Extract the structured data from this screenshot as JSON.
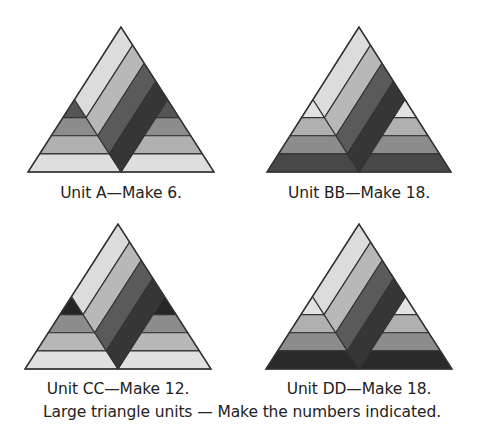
{
  "figure": {
    "caption": "Large triangle units — Make the numbers indicated.",
    "stroke_color": "#333333",
    "units": [
      {
        "id": "A",
        "label": "Unit A—Make 6.",
        "quantity": 6,
        "geometry": {
          "apex_x": 121,
          "apex_y": 27,
          "half_width": 93,
          "height": 145
        },
        "caption_pos": {
          "x": 121,
          "y": 184
        },
        "diagonal_stripes": [
          "#dcdcdc",
          "#b8b8b8",
          "#5a5a5a",
          "#363636"
        ],
        "side_bands": [
          "#555555",
          "#8c8c8c",
          "#b0b0b0",
          "#dedede"
        ]
      },
      {
        "id": "BB",
        "label": "Unit BB—Make 18.",
        "quantity": 18,
        "geometry": {
          "apex_x": 359,
          "apex_y": 27,
          "half_width": 92,
          "height": 145
        },
        "caption_pos": {
          "x": 359,
          "y": 184
        },
        "diagonal_stripes": [
          "#dcdcdc",
          "#b8b8b8",
          "#5a5a5a",
          "#363636"
        ],
        "side_bands": [
          "#e2e2e2",
          "#b0b0b0",
          "#8c8c8c",
          "#484848"
        ]
      },
      {
        "id": "CC",
        "label": "Unit CC—Make 12.",
        "quantity": 12,
        "geometry": {
          "apex_x": 118,
          "apex_y": 224,
          "half_width": 93,
          "height": 145
        },
        "caption_pos": {
          "x": 118,
          "y": 380
        },
        "diagonal_stripes": [
          "#dcdcdc",
          "#b8b8b8",
          "#5a5a5a",
          "#363636"
        ],
        "side_bands": [
          "#262626",
          "#8c8c8c",
          "#b8b8b8",
          "#e0e0e0"
        ]
      },
      {
        "id": "DD",
        "label": "Unit DD—Make 18.",
        "quantity": 18,
        "geometry": {
          "apex_x": 359,
          "apex_y": 224,
          "half_width": 93,
          "height": 145
        },
        "caption_pos": {
          "x": 359,
          "y": 380
        },
        "diagonal_stripes": [
          "#dcdcdc",
          "#b8b8b8",
          "#5a5a5a",
          "#363636"
        ],
        "side_bands": [
          "#e2e2e2",
          "#b0b0b0",
          "#8c8c8c",
          "#2a2a2a"
        ]
      }
    ]
  }
}
